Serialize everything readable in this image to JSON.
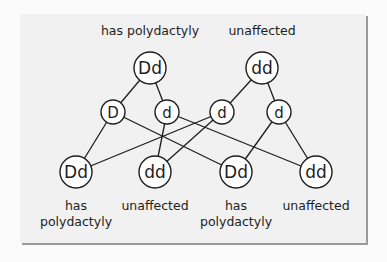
{
  "diagram": {
    "type": "genetic-cross",
    "parents": [
      {
        "id": "p1",
        "genotype": "Dd",
        "label": "has polydactyly",
        "x": 150,
        "y": 68
      },
      {
        "id": "p2",
        "genotype": "dd",
        "label": "unaffected",
        "x": 262,
        "y": 68
      }
    ],
    "gametes": [
      {
        "id": "g1",
        "allele": "D",
        "parent": "p1",
        "x": 113,
        "y": 112
      },
      {
        "id": "g2",
        "allele": "d",
        "parent": "p1",
        "x": 167,
        "y": 112
      },
      {
        "id": "g3",
        "allele": "d",
        "parent": "p2",
        "x": 222,
        "y": 112
      },
      {
        "id": "g4",
        "allele": "d",
        "parent": "p2",
        "x": 279,
        "y": 112
      }
    ],
    "offspring": [
      {
        "id": "o1",
        "genotype": "Dd",
        "label_line1": "has",
        "label_line2": "polydactyly",
        "x": 76,
        "y": 172
      },
      {
        "id": "o2",
        "genotype": "dd",
        "label_line1": "unaffected",
        "label_line2": "",
        "x": 155,
        "y": 172
      },
      {
        "id": "o3",
        "genotype": "Dd",
        "label_line1": "has",
        "label_line2": "polydactyly",
        "x": 236,
        "y": 172
      },
      {
        "id": "o4",
        "genotype": "dd",
        "label_line1": "unaffected",
        "label_line2": "",
        "x": 316,
        "y": 172
      }
    ],
    "edges": [
      [
        "p1",
        "g1"
      ],
      [
        "p1",
        "g2"
      ],
      [
        "p2",
        "g3"
      ],
      [
        "p2",
        "g4"
      ],
      [
        "g1",
        "o1"
      ],
      [
        "g1",
        "o3"
      ],
      [
        "g2",
        "o2"
      ],
      [
        "g2",
        "o4"
      ],
      [
        "g3",
        "o1"
      ],
      [
        "g3",
        "o2"
      ],
      [
        "g4",
        "o3"
      ],
      [
        "g4",
        "o4"
      ]
    ]
  },
  "background_text": {
    "line1": "genetic diagram you just ...",
    "line2": ""
  }
}
